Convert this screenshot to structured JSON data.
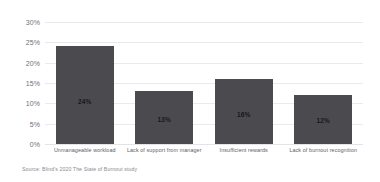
{
  "chart_title": "",
  "source_note": "Source: Blind's 2020 The State of Burnout study",
  "chart_data": {
    "type": "bar",
    "title": "",
    "subtitle": "",
    "xlabel": "",
    "ylabel": "",
    "ylim": [
      0,
      30
    ],
    "ytick_labels": [
      "30%",
      "25%",
      "20%",
      "15%",
      "10%",
      "5%",
      "0%"
    ],
    "ytick_values": [
      30,
      25,
      20,
      15,
      10,
      5,
      0
    ],
    "grid": true,
    "legend": false,
    "legend_position": "none",
    "bar_color": "#4b4b4f",
    "gridline_color": "#e9e9ee",
    "categories": [
      "Unmanageable workload",
      "Lack of support from manager",
      "Insufficient rewards",
      "Lack of burnout recognition"
    ],
    "values": [
      24,
      13,
      16,
      12
    ],
    "data_labels": [
      "24%",
      "13%",
      "16%",
      "12%"
    ]
  }
}
